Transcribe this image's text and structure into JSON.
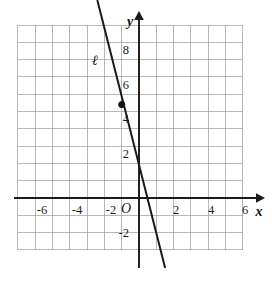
{
  "figure": {
    "background_color": "#ffffff",
    "grid_color": "#9a9a9a",
    "axis_color": "#1a1a1a"
  },
  "labels": {
    "x_axis_name": "x",
    "y_axis_name": "y",
    "origin": "O",
    "line_name": "ℓ"
  },
  "chart_data": {
    "type": "line",
    "title": "",
    "xlabel": "x",
    "ylabel": "y",
    "xlim": [
      -7.0,
      6.6
    ],
    "ylim": [
      -3.6,
      10.6
    ],
    "grid": true,
    "grid_step": 1,
    "legend": "none",
    "x_ticks": [
      -6,
      -4,
      -2,
      2,
      4,
      6
    ],
    "x_tick_labels": [
      "-6",
      "-4",
      "-2",
      "2",
      "4",
      "6"
    ],
    "y_ticks": [
      -2,
      2,
      4,
      6,
      8
    ],
    "y_tick_labels": [
      "-2",
      "2",
      "4",
      "6",
      "8"
    ],
    "series": [
      {
        "name": "ℓ",
        "type": "line",
        "slope": -3,
        "y_intercept": 4.2,
        "x_intercept": 1.4,
        "x_start": -2.4,
        "y_start": 11.4,
        "x_end": 1.5,
        "y_end": -4.0,
        "label": "ℓ",
        "label_x": -2.55,
        "label_y": 7.7
      }
    ],
    "points": [
      {
        "label": "",
        "x": -1,
        "y": 5.4,
        "marker": "filled-circle"
      }
    ]
  }
}
